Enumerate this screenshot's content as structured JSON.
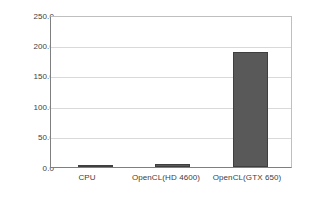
{
  "chart_data": {
    "type": "bar",
    "title": "",
    "subtitle": "",
    "xlabel": "",
    "ylabel": "",
    "categories": [
      "CPU",
      "OpenCL(HD 4600)",
      "OpenCL(GTX 650)"
    ],
    "values": [
      1.5,
      5.0,
      192.0
    ],
    "series": [
      {
        "name": "",
        "values": [
          1.5,
          5.0,
          192.0
        ]
      }
    ],
    "ylim": [
      0.0,
      250.0
    ],
    "yticks": [
      0.0,
      50.0,
      100.0,
      150.0,
      200.0,
      250.0
    ],
    "ytick_labels": [
      "0.0",
      "50.0",
      "100.0",
      "150.0",
      "200.0",
      "250.0"
    ],
    "grid": true,
    "grid_axis": "y",
    "legend": false,
    "legend_position": "none",
    "bar_color": "#595959",
    "bar_edge_color": "#3f3f3f",
    "grid_color": "#d9d9d9",
    "axis_color": "#7f7f7f",
    "plot_background": "#ffffff",
    "tick_label_color": "#404040"
  }
}
